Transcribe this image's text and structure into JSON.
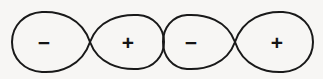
{
  "figure": {
    "background_color": "#f7f6f4",
    "stroke_color": "#191919",
    "label_color": "#141414",
    "stroke_width": 2,
    "width": 323,
    "height": 79
  },
  "orbitals": [
    {
      "name": "orbital-left",
      "node_x": 90,
      "node_y": 42,
      "lobes": [
        {
          "name": "lobe-left-negative",
          "sign": "−",
          "sign_name": "minus-sign",
          "label_x": 44,
          "label_y": 42,
          "tip_x": 90,
          "tip_y": 42,
          "outer_x": 12,
          "top_y": 12,
          "bottom_y": 72
        },
        {
          "name": "lobe-left-positive",
          "sign": "+",
          "sign_name": "plus-sign",
          "label_x": 128,
          "label_y": 42,
          "tip_x": 90,
          "tip_y": 42,
          "outer_x": 164,
          "top_y": 15,
          "bottom_y": 69
        }
      ]
    },
    {
      "name": "orbital-right",
      "node_x": 235,
      "node_y": 42,
      "lobes": [
        {
          "name": "lobe-right-negative",
          "sign": "−",
          "sign_name": "minus-sign",
          "label_x": 191,
          "label_y": 42,
          "tip_x": 235,
          "tip_y": 42,
          "outer_x": 163,
          "top_y": 15,
          "bottom_y": 69
        },
        {
          "name": "lobe-right-positive",
          "sign": "+",
          "sign_name": "plus-sign",
          "label_x": 277,
          "label_y": 42,
          "tip_x": 235,
          "tip_y": 42,
          "outer_x": 313,
          "top_y": 12,
          "bottom_y": 72
        }
      ]
    }
  ],
  "paths": {
    "lobe_left_negative": "M 90 42 C 82 18 60 11 42 12 C 24 13 12 26 12 42 C 12 58 24 71 42 72 C 60 73 82 66 90 42 Z",
    "lobe_left_positive": "M 90 42 C 98 20 120 14 138 15 C 154 16 164 28 164 42 C 164 56 154 68 138 69 C 120 70 98 64 90 42 Z",
    "lobe_right_negative": "M 235 42 C 227 20 205 14 187 15 C 172 16 163 28 163 42 C 163 56 172 68 187 69 C 205 70 227 64 235 42 Z",
    "lobe_right_positive": "M 235 42 C 243 18 265 11 283 12 C 301 13 313 26 313 42 C 313 58 301 71 283 72 C 265 73 243 66 235 42 Z"
  }
}
